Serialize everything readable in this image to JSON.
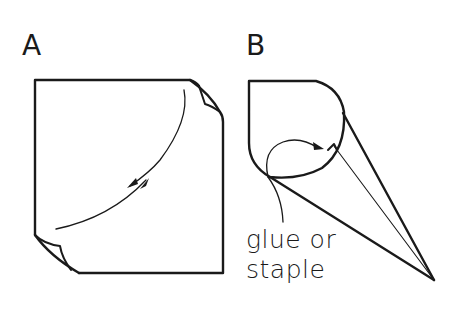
{
  "figure": {
    "panels": [
      {
        "id": "A",
        "label": "A",
        "description": "Square sheet with two opposite curled corners and a double-headed curved arrow indicating rolling"
      },
      {
        "id": "B",
        "label": "B",
        "description": "Sheet rolled into a cone shape",
        "annotation": {
          "line1": "glue or",
          "line2": "staple"
        }
      }
    ],
    "colors": {
      "stroke": "#1a1a1a",
      "background": "#ffffff"
    }
  }
}
